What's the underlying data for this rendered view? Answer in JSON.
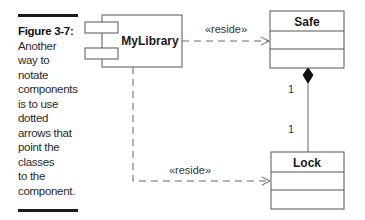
{
  "caption": {
    "figure_label": "Figure 3-7:",
    "lines": [
      "Another",
      "way to",
      "notate",
      "components",
      "is to use",
      "dotted",
      "arrows that",
      "point the",
      "classes",
      "to the",
      "component."
    ]
  },
  "diagram": {
    "component": {
      "name": "MyLibrary"
    },
    "classes": [
      {
        "name": "Safe"
      },
      {
        "name": "Lock"
      }
    ],
    "dependencies": [
      {
        "from": "MyLibrary",
        "to": "Safe",
        "stereotype": "«reside»"
      },
      {
        "from": "MyLibrary",
        "to": "Lock",
        "stereotype": "«reside»"
      }
    ],
    "composition": {
      "whole": "Safe",
      "part": "Lock",
      "whole_multiplicity": "1",
      "part_multiplicity": "1"
    }
  },
  "colors": {
    "line": "#555555",
    "text": "#1a1a1a",
    "rule": "#1a1a1a"
  }
}
